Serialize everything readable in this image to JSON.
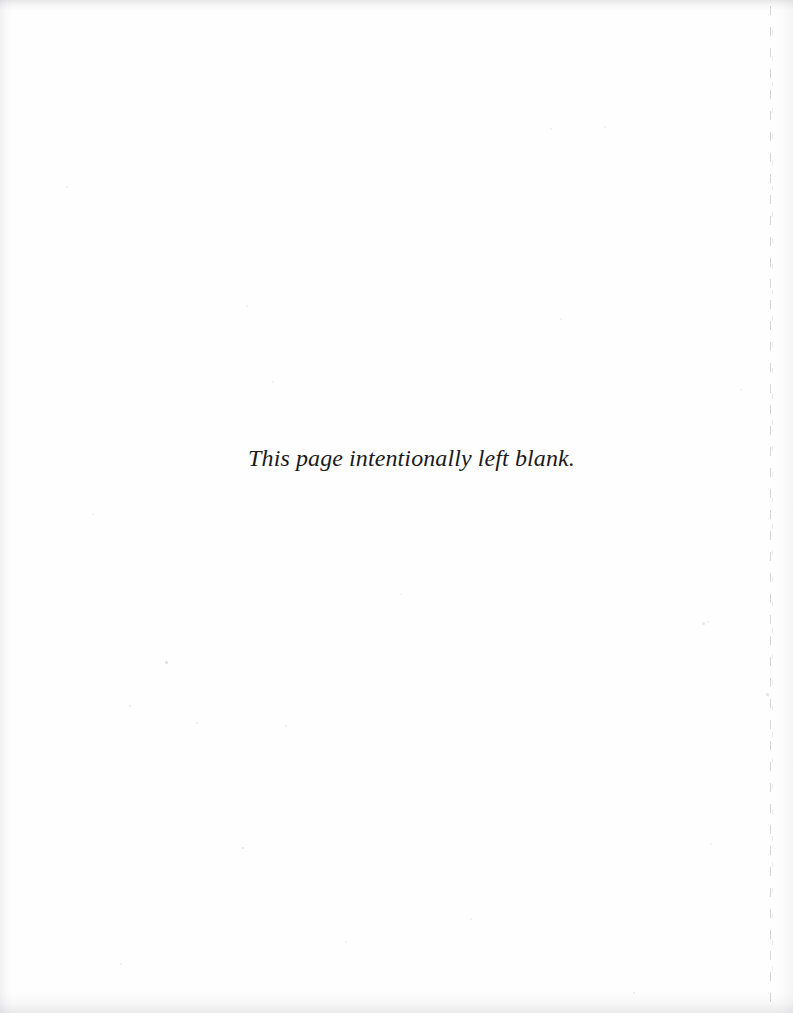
{
  "document": {
    "page_type": "intentionally-blank-page",
    "background_color": "#fefefe",
    "text_color": "#1c1a1c",
    "body": {
      "notice": "This page intentionally left blank."
    },
    "artifacts": {
      "gutter_line_label": "dashed-page-edge-line",
      "edge_shadow_color": "#96969b",
      "specks": [
        {
          "x": 165,
          "y": 661,
          "size": 3,
          "opacity": 0.3
        },
        {
          "x": 129,
          "y": 705,
          "size": 2,
          "opacity": 0.22
        },
        {
          "x": 242,
          "y": 847,
          "size": 2,
          "opacity": 0.26
        },
        {
          "x": 196,
          "y": 722,
          "size": 2,
          "opacity": 0.18
        },
        {
          "x": 285,
          "y": 725,
          "size": 2,
          "opacity": 0.16
        },
        {
          "x": 702,
          "y": 622,
          "size": 3,
          "opacity": 0.18
        },
        {
          "x": 707,
          "y": 621,
          "size": 2,
          "opacity": 0.14
        },
        {
          "x": 766,
          "y": 693,
          "size": 3,
          "opacity": 0.24
        },
        {
          "x": 740,
          "y": 389,
          "size": 2,
          "opacity": 0.14
        },
        {
          "x": 604,
          "y": 126,
          "size": 2,
          "opacity": 0.12
        },
        {
          "x": 550,
          "y": 128,
          "size": 2,
          "opacity": 0.12
        },
        {
          "x": 66,
          "y": 186,
          "size": 2,
          "opacity": 0.12
        },
        {
          "x": 272,
          "y": 381,
          "size": 2,
          "opacity": 0.14
        },
        {
          "x": 246,
          "y": 305,
          "size": 2,
          "opacity": 0.12
        },
        {
          "x": 560,
          "y": 318,
          "size": 2,
          "opacity": 0.12
        },
        {
          "x": 120,
          "y": 963,
          "size": 2,
          "opacity": 0.16
        },
        {
          "x": 345,
          "y": 941,
          "size": 2,
          "opacity": 0.12
        },
        {
          "x": 470,
          "y": 918,
          "size": 2,
          "opacity": 0.12
        },
        {
          "x": 633,
          "y": 992,
          "size": 2,
          "opacity": 0.18
        },
        {
          "x": 92,
          "y": 513,
          "size": 2,
          "opacity": 0.12
        },
        {
          "x": 710,
          "y": 843,
          "size": 2,
          "opacity": 0.12
        },
        {
          "x": 400,
          "y": 593,
          "size": 2,
          "opacity": 0.1
        }
      ]
    }
  }
}
